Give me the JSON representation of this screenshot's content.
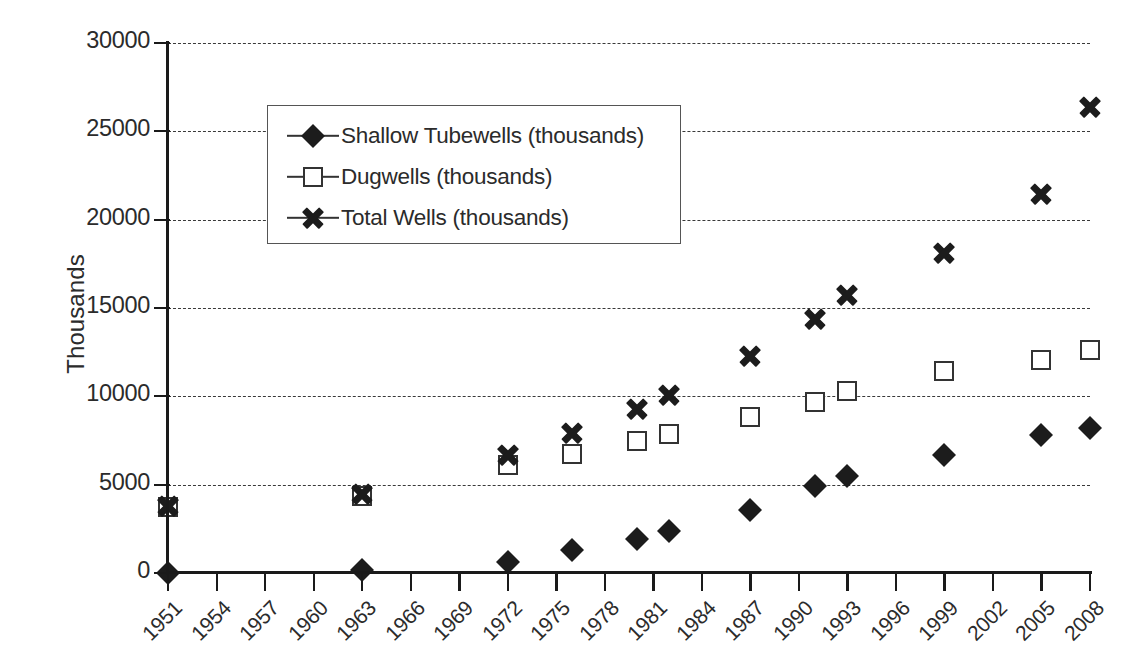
{
  "chart_data": {
    "type": "scatter",
    "title": "",
    "xlabel": "",
    "ylabel": "Thousands",
    "ylim": [
      0,
      30000
    ],
    "ytick_labels": [
      "30000",
      "25000",
      "20000",
      "15000",
      "10000",
      "5000",
      "0"
    ],
    "ytick_values": [
      30000,
      25000,
      20000,
      15000,
      10000,
      5000,
      0
    ],
    "xtick_labels": [
      "1951",
      "1954",
      "1957",
      "1960",
      "1963",
      "1966",
      "1969",
      "1972",
      "1975",
      "1978",
      "1981",
      "1984",
      "1987",
      "1990",
      "1993",
      "1996",
      "1999",
      "2002",
      "2005",
      "2008"
    ],
    "xlim": [
      1951,
      2008
    ],
    "grid": true,
    "grid_style": "dashed-horizontal",
    "legend_position": "upper-left-inside",
    "series": [
      {
        "name": "Shallow Tubewells (thousands)",
        "marker": "filled-diamond",
        "color": "#1c1c1c",
        "x": [
          1951,
          1963,
          1972,
          1976,
          1980,
          1982,
          1987,
          1991,
          1993,
          1999,
          2005,
          2008
        ],
        "values": [
          0,
          180,
          600,
          1300,
          1950,
          2350,
          3550,
          4950,
          5500,
          6700,
          7800,
          8200
        ]
      },
      {
        "name": "Dugwells (thousands)",
        "marker": "open-square",
        "color": "#333333",
        "x": [
          1951,
          1963,
          1972,
          1976,
          1980,
          1982,
          1987,
          1991,
          1993,
          1999,
          2005,
          2008
        ],
        "values": [
          3750,
          4350,
          6100,
          6750,
          7500,
          7850,
          8850,
          9700,
          10300,
          11450,
          12050,
          12600
        ]
      },
      {
        "name": "Total Wells (thousands)",
        "marker": "bold-x",
        "color": "#1c1c1c",
        "x": [
          1951,
          1963,
          1972,
          1976,
          1980,
          1982,
          1987,
          1991,
          1993,
          1999,
          2005,
          2008
        ],
        "values": [
          3800,
          4500,
          6700,
          7950,
          9300,
          10100,
          12300,
          14400,
          15750,
          18100,
          21450,
          26400
        ]
      }
    ]
  },
  "legend": {
    "entries": [
      {
        "label": "Shallow Tubewells (thousands)",
        "marker": "filled-diamond"
      },
      {
        "label": "Dugwells (thousands)",
        "marker": "open-square"
      },
      {
        "label": "Total Wells (thousands)",
        "marker": "bold-x"
      }
    ]
  },
  "axis": {
    "y_title": "Thousands"
  }
}
